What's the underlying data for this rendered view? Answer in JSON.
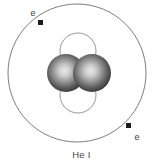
{
  "figure": {
    "caption": "He I",
    "background_color": "#ffffff",
    "width": 163,
    "height": 165
  },
  "orbit": {
    "name": "electron-shell",
    "center_x": 77,
    "center_y": 73,
    "radius": 69,
    "stroke_color": "#6e6e6e"
  },
  "electrons": [
    {
      "label": "e",
      "marker_x": 40.5,
      "marker_y": 22.5,
      "marker_size": 5,
      "label_x": 33,
      "label_y": 14,
      "color": "#1a1a1a"
    },
    {
      "label": "e",
      "marker_x": 128.5,
      "marker_y": 125.5,
      "marker_size": 5,
      "label_x": 136,
      "label_y": 139,
      "color": "#1a1a1a"
    }
  ],
  "nucleus": {
    "center_x": 78,
    "center_y": 73,
    "particles": [
      {
        "kind": "neutron",
        "name": "nucleon-neutron-top",
        "cx": 78,
        "cy": 51,
        "r": 18,
        "fill_color": "#ffffff",
        "stroke_color": "#8a8a8a"
      },
      {
        "kind": "neutron",
        "name": "nucleon-neutron-bottom",
        "cx": 78,
        "cy": 95,
        "r": 18,
        "fill_color": "#ffffff",
        "stroke_color": "#8a8a8a"
      },
      {
        "kind": "proton",
        "name": "nucleon-proton-left",
        "cx": 66,
        "cy": 73,
        "r": 19,
        "fill_color": "#3c3c3c",
        "highlight_color": "#d6d6d6"
      },
      {
        "kind": "proton",
        "name": "nucleon-proton-right",
        "cx": 92,
        "cy": 73,
        "r": 19,
        "fill_color": "#3c3c3c",
        "highlight_color": "#d6d6d6"
      }
    ]
  }
}
